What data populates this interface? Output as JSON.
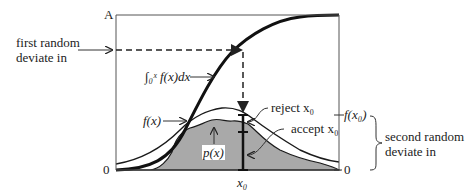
{
  "diagram": {
    "axis_top_label": "A",
    "axis_zero_left": "0",
    "axis_zero_right": "0",
    "x0_label": "x₀",
    "labels": {
      "first_deviate": [
        "first random",
        "deviate in"
      ],
      "integral": "∫₀ˣ f(x)dx",
      "fx": "f(x)",
      "px": "p(x)",
      "reject": "reject x₀",
      "accept": "accept x₀",
      "fx0": "f(x₀)",
      "second_deviate": [
        "second random",
        "deviate in"
      ]
    },
    "colors": {
      "shaded_area": "#a9a9a9",
      "curve": "#1a1a1a",
      "frame": "#555555"
    }
  }
}
